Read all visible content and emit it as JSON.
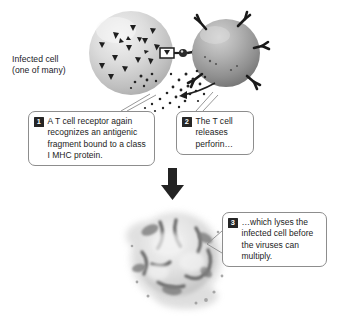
{
  "figure": {
    "background_color": "#ffffff",
    "line_color": "#8d8d8d",
    "badge_color": "#262626",
    "badge_text_color": "#ffffff"
  },
  "labels": {
    "infected_cell": {
      "line1": "Infected cell",
      "line2": "(one of many)"
    }
  },
  "steps": [
    {
      "number": "1",
      "text": "A T cell receptor again recognizes an antigenic fragment bound to a class I MHC protein."
    },
    {
      "number": "2",
      "text": "The T cell releases perforin…"
    },
    {
      "number": "3",
      "text": "…which lyses the infected cell before the viruses can multiply."
    }
  ],
  "graphics": {
    "infected_cell_icon": "light-gray-sphere-with-viral-fragments",
    "t_cell_icon": "dark-gray-sphere-with-y-receptors",
    "mhc_complex_icon": "mhc-antigen-receptor-junction",
    "perforin_icon": "perforin-granule-spray",
    "process_arrow_icon": "down-arrow",
    "lysed_cell_icon": "fragmenting-lysed-cell"
  }
}
